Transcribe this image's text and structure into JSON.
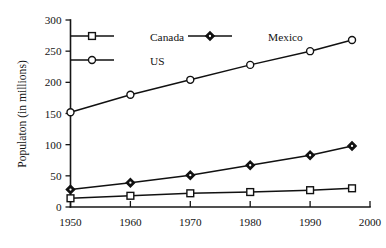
{
  "chart_data": {
    "type": "line",
    "title": "",
    "xlabel": "",
    "ylabel": "Populaton (in millions)",
    "x": [
      1950,
      1960,
      1970,
      1980,
      1990,
      1997
    ],
    "xlim": [
      1950,
      2000
    ],
    "ylim": [
      0,
      300
    ],
    "xticks": [
      "1950",
      "1960",
      "1970",
      "1980",
      "1990",
      "2000"
    ],
    "xtick_values": [
      1950,
      1960,
      1970,
      1980,
      1990,
      2000
    ],
    "yticks": [
      "0",
      "50",
      "100",
      "150",
      "200",
      "250",
      "300"
    ],
    "ytick_values": [
      0,
      50,
      100,
      150,
      200,
      250,
      300
    ],
    "grid": false,
    "legend_position": "inside-top-left",
    "series": [
      {
        "name": "Canada",
        "marker": "open-square",
        "color": "#111111",
        "values": [
          14,
          18,
          22,
          24,
          27,
          30
        ]
      },
      {
        "name": "Mexico",
        "marker": "filled-diamond",
        "color": "#111111",
        "values": [
          28,
          39,
          51,
          67,
          83,
          98
        ]
      },
      {
        "name": "US",
        "marker": "open-circle",
        "color": "#111111",
        "values": [
          152,
          180,
          204,
          228,
          250,
          268
        ]
      }
    ]
  },
  "legend": {
    "items": [
      {
        "label": "Canada",
        "marker": "open-square"
      },
      {
        "label": "Mexico",
        "marker": "filled-diamond"
      },
      {
        "label": "US",
        "marker": "open-circle"
      }
    ]
  },
  "axes": {
    "y_title": "Populaton (in millions)"
  }
}
